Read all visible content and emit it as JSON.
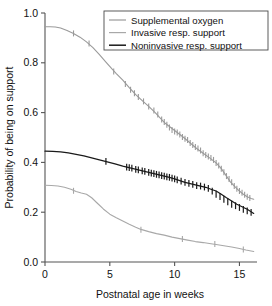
{
  "chart_data": {
    "type": "line",
    "title": "",
    "subtitle": "",
    "xlabel": "Postnatal age in weeks",
    "ylabel": "Probability of being on support",
    "xlim": [
      0,
      16.2
    ],
    "ylim": [
      0,
      1.0
    ],
    "xticks": [
      0,
      5,
      10,
      15
    ],
    "xticklabels": [
      "0",
      "5",
      "10",
      "15"
    ],
    "yticks": [
      0.0,
      0.2,
      0.4,
      0.6,
      0.8,
      1.0
    ],
    "yticklabels": [
      "0.0",
      "0.2",
      "0.4",
      "0.6",
      "0.8",
      "1.0"
    ],
    "grid": false,
    "legend_position": "top-right",
    "annotations": [],
    "note": "Kaplan-Meier style survival curves with censoring tick marks",
    "series": [
      {
        "name": "Supplemental oxygen",
        "color": "#9a9a9a",
        "linewidth": 1.1,
        "x": [
          0.0,
          0.4,
          0.8,
          1.2,
          1.7,
          2.2,
          2.7,
          3.2,
          3.7,
          4.2,
          4.7,
          5.2,
          5.5,
          6.0,
          6.5,
          7.0,
          7.5,
          8.0,
          8.5,
          9.0,
          9.3,
          9.7,
          10.2,
          10.7,
          11.2,
          11.7,
          12.2,
          12.7,
          13.2,
          13.6,
          14.0,
          14.3,
          14.7,
          15.0,
          15.3,
          15.6,
          15.9,
          16.1
        ],
        "y": [
          0.945,
          0.945,
          0.944,
          0.94,
          0.93,
          0.918,
          0.903,
          0.884,
          0.861,
          0.833,
          0.803,
          0.774,
          0.757,
          0.73,
          0.7,
          0.672,
          0.648,
          0.625,
          0.6,
          0.572,
          0.556,
          0.54,
          0.52,
          0.5,
          0.478,
          0.456,
          0.437,
          0.418,
          0.398,
          0.375,
          0.345,
          0.322,
          0.3,
          0.285,
          0.272,
          0.262,
          0.255,
          0.252
        ],
        "censor_x": [
          2.2,
          3.4,
          5.3,
          6.2,
          6.6,
          6.9,
          7.2,
          7.6,
          8.0,
          8.4,
          8.7,
          9.0,
          9.2,
          9.4,
          9.6,
          9.8,
          10.0,
          10.2,
          10.4,
          10.6,
          10.8,
          11.0,
          11.2,
          11.4,
          11.6,
          11.8,
          12.0,
          12.2,
          12.4,
          12.6,
          12.8,
          13.0,
          13.2,
          13.4,
          13.6,
          13.8,
          14.0,
          14.2,
          14.4,
          14.6,
          14.8,
          15.0,
          15.2,
          15.4,
          15.6,
          15.8
        ],
        "censor_y": [
          0.918,
          0.878,
          0.765,
          0.715,
          0.692,
          0.678,
          0.663,
          0.645,
          0.625,
          0.608,
          0.592,
          0.572,
          0.562,
          0.551,
          0.54,
          0.53,
          0.524,
          0.52,
          0.512,
          0.502,
          0.495,
          0.49,
          0.478,
          0.47,
          0.462,
          0.456,
          0.448,
          0.437,
          0.43,
          0.424,
          0.418,
          0.41,
          0.398,
          0.388,
          0.375,
          0.36,
          0.345,
          0.333,
          0.32,
          0.305,
          0.294,
          0.285,
          0.278,
          0.27,
          0.262,
          0.257
        ]
      },
      {
        "name": "Invasive resp. support",
        "color": "#a8a8a8",
        "linewidth": 1.1,
        "x": [
          0.0,
          0.5,
          1.0,
          1.5,
          2.0,
          2.4,
          2.8,
          3.2,
          3.6,
          4.0,
          4.5,
          5.0,
          5.5,
          6.0,
          6.5,
          7.0,
          7.4,
          8.0,
          8.6,
          9.2,
          9.8,
          10.4,
          11.0,
          11.6,
          12.2,
          12.8,
          13.2,
          13.8,
          14.4,
          15.0,
          15.5,
          16.1
        ],
        "y": [
          0.308,
          0.307,
          0.305,
          0.3,
          0.292,
          0.283,
          0.277,
          0.272,
          0.258,
          0.238,
          0.213,
          0.192,
          0.178,
          0.165,
          0.152,
          0.14,
          0.131,
          0.122,
          0.114,
          0.108,
          0.1,
          0.094,
          0.088,
          0.082,
          0.078,
          0.073,
          0.07,
          0.065,
          0.06,
          0.054,
          0.048,
          0.042
        ],
        "censor_x": [
          2.2,
          7.4,
          10.6,
          13.1,
          15.3
        ],
        "censor_y": [
          0.286,
          0.13,
          0.092,
          0.072,
          0.05
        ]
      },
      {
        "name": "Noninvasive resp. support",
        "color": "#1a1a1a",
        "linewidth": 1.2,
        "x": [
          0.0,
          0.6,
          1.2,
          1.8,
          2.4,
          3.0,
          3.6,
          4.2,
          4.8,
          5.4,
          6.0,
          6.4,
          6.8,
          7.2,
          7.6,
          8.0,
          8.4,
          8.8,
          9.2,
          9.6,
          10.0,
          10.4,
          10.8,
          11.2,
          11.6,
          12.0,
          12.4,
          12.8,
          13.2,
          13.6,
          14.0,
          14.4,
          14.8,
          15.2,
          15.6,
          15.9,
          16.1
        ],
        "y": [
          0.445,
          0.444,
          0.442,
          0.438,
          0.432,
          0.426,
          0.418,
          0.41,
          0.402,
          0.394,
          0.385,
          0.38,
          0.375,
          0.37,
          0.365,
          0.36,
          0.355,
          0.35,
          0.345,
          0.34,
          0.334,
          0.327,
          0.32,
          0.315,
          0.31,
          0.305,
          0.3,
          0.292,
          0.285,
          0.272,
          0.258,
          0.245,
          0.232,
          0.222,
          0.212,
          0.202,
          0.195
        ],
        "censor_x": [
          4.7,
          6.3,
          6.5,
          6.7,
          7.0,
          7.2,
          7.5,
          7.7,
          8.0,
          8.2,
          8.4,
          8.6,
          8.8,
          9.0,
          9.2,
          9.4,
          9.6,
          9.8,
          10.0,
          10.2,
          10.5,
          10.8,
          11.1,
          11.4,
          11.7,
          12.0,
          12.3,
          12.6,
          12.9,
          13.2,
          13.5,
          13.8,
          14.1,
          14.4,
          14.7,
          15.0,
          15.3,
          15.6,
          15.9
        ],
        "censor_y": [
          0.404,
          0.381,
          0.379,
          0.377,
          0.372,
          0.37,
          0.366,
          0.364,
          0.36,
          0.357,
          0.355,
          0.352,
          0.35,
          0.347,
          0.345,
          0.342,
          0.34,
          0.337,
          0.334,
          0.33,
          0.325,
          0.32,
          0.316,
          0.312,
          0.307,
          0.305,
          0.301,
          0.296,
          0.285,
          0.272,
          0.263,
          0.252,
          0.242,
          0.232,
          0.226,
          0.219,
          0.211,
          0.205,
          0.199
        ]
      }
    ]
  },
  "legend": {
    "items": [
      {
        "label": "Supplemental oxygen",
        "color": "#9a9a9a"
      },
      {
        "label": "Invasive resp. support",
        "color": "#a8a8a8"
      },
      {
        "label": "Noninvasive resp. support",
        "color": "#1a1a1a"
      }
    ]
  },
  "axes": {
    "x_title": "Postnatal age in weeks",
    "y_title": "Probability of being on support",
    "x_tick_labels": [
      "0",
      "5",
      "10",
      "15"
    ],
    "y_tick_labels": [
      "0.0",
      "0.2",
      "0.4",
      "0.6",
      "0.8",
      "1.0"
    ]
  }
}
